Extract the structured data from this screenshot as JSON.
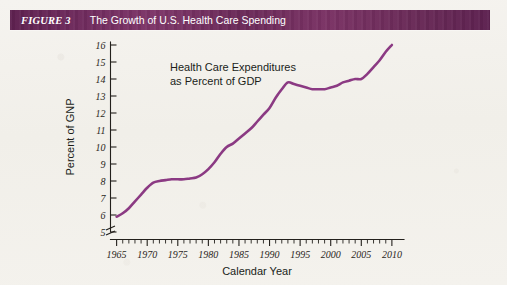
{
  "figure": {
    "label": "FIGURE 3",
    "title": "The Growth of U.S. Health Care Spending"
  },
  "colors": {
    "header_bar": "#6b2a59",
    "header_text": "#ffffff",
    "line": "#8b3a83",
    "axis": "#23201c",
    "page": "#f3f1ec"
  },
  "chart_data": {
    "type": "line",
    "title": "The Growth of U.S. Health Care Spending",
    "subtitle": "",
    "xlabel": "Calendar Year",
    "ylabel": "Percent of GNP",
    "annotation": {
      "line1": "Health Care Expenditures",
      "line2": "as Percent of GDP"
    },
    "xlim": [
      1964,
      2011
    ],
    "ylim": [
      5,
      16
    ],
    "y_axis_break": true,
    "grid": false,
    "legend": "none",
    "x_major_ticks": [
      1965,
      1970,
      1975,
      1980,
      1985,
      1990,
      1995,
      2000,
      2005,
      2010
    ],
    "x_tick_labels": [
      "1965",
      "1970",
      "1975",
      "1980",
      "1985",
      "1990",
      "1995",
      "2000",
      "2005",
      "2010"
    ],
    "x_minor_tick_interval": 1,
    "y_ticks": [
      5,
      6,
      7,
      8,
      9,
      10,
      11,
      12,
      13,
      14,
      15,
      16
    ],
    "y_tick_labels": [
      "5",
      "6",
      "7",
      "8",
      "9",
      "10",
      "11",
      "12",
      "13",
      "14",
      "15",
      "16"
    ],
    "series": [
      {
        "name": "Health Care Expenditures as Percent of GDP",
        "color": "#8b3a83",
        "x": [
          1965,
          1966,
          1967,
          1968,
          1969,
          1970,
          1971,
          1972,
          1973,
          1974,
          1975,
          1976,
          1977,
          1978,
          1979,
          1980,
          1981,
          1982,
          1983,
          1984,
          1985,
          1986,
          1987,
          1988,
          1989,
          1990,
          1991,
          1992,
          1993,
          1994,
          1995,
          1996,
          1997,
          1998,
          1999,
          2000,
          2001,
          2002,
          2003,
          2004,
          2005,
          2006,
          2007,
          2008,
          2009,
          2010
        ],
        "values": [
          5.9,
          6.1,
          6.4,
          6.8,
          7.2,
          7.6,
          7.9,
          8.0,
          8.05,
          8.1,
          8.1,
          8.1,
          8.15,
          8.2,
          8.4,
          8.7,
          9.1,
          9.6,
          10.0,
          10.2,
          10.5,
          10.8,
          11.1,
          11.5,
          11.9,
          12.3,
          12.9,
          13.4,
          13.8,
          13.7,
          13.6,
          13.5,
          13.4,
          13.4,
          13.4,
          13.5,
          13.6,
          13.8,
          13.9,
          14.0,
          14.0,
          14.3,
          14.7,
          15.1,
          15.6,
          16.0
        ]
      }
    ]
  }
}
